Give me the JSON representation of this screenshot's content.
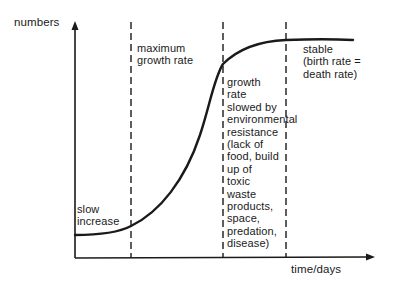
{
  "diagram": {
    "y_axis_label": "numbers",
    "x_axis_label": "time/days",
    "phases": [
      {
        "id": "slow",
        "text": "slow\nincrease"
      },
      {
        "id": "max",
        "text": "maximum\ngrowth rate"
      },
      {
        "id": "slowed",
        "text": "growth\nrate\nslowed by\nenvironmental\nresistance\n(lack of\nfood, build\nup of\ntoxic\nwaste\nproducts,\nspace,\npredation,\ndisease)"
      },
      {
        "id": "stable",
        "text": "stable\n(birth rate =\ndeath rate)"
      }
    ],
    "colors": {
      "ink": "#1a1a1a",
      "background": "#ffffff"
    }
  }
}
